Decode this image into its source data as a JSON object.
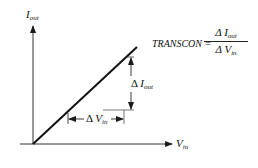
{
  "diagram": {
    "y_axis_label": {
      "main": "I",
      "sub": "out"
    },
    "x_axis_label": {
      "main": "V",
      "sub": "in"
    },
    "delta_iout_label": {
      "delta": "Δ",
      "main": "I",
      "sub": "out"
    },
    "delta_vin_label": {
      "delta": "Δ",
      "main": "V",
      "sub": "in"
    },
    "equation": {
      "lhs": "TRANSCON =",
      "numerator": "Δ I",
      "numerator_sub": "out",
      "denominator": "Δ V",
      "denominator_sub": "in"
    },
    "colors": {
      "line": "#1a1a1a",
      "background": "#ffffff"
    }
  }
}
